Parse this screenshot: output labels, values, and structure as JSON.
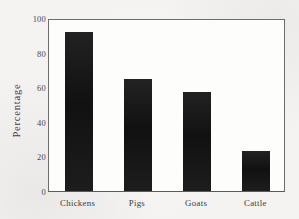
{
  "chart_data": {
    "type": "bar",
    "title": "",
    "subtitle": "",
    "xlabel": "",
    "ylabel": "Percentage",
    "categories": [
      "Chickens",
      "Pigs",
      "Goats",
      "Cattle"
    ],
    "values": [
      92,
      65,
      57,
      23
    ],
    "ylim": [
      0,
      100
    ],
    "yticks": [
      0,
      20,
      40,
      60,
      80,
      100
    ],
    "ytick_labels": [
      "0",
      "20",
      "40",
      "60",
      "80",
      "100"
    ],
    "grid": false,
    "legend": null,
    "bar_color": "#1a1a1a",
    "axis_color": "#6d6d6d",
    "plot_background": "#fdfdfc",
    "page_background": "#f4f3f1"
  },
  "axes": {
    "y_title": "Percentage"
  }
}
